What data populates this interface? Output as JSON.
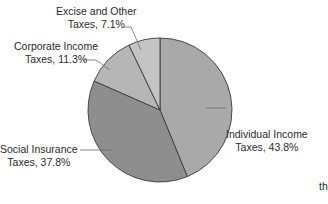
{
  "chart_data": {
    "type": "pie",
    "title": "",
    "categories": [
      "Individual Income Taxes",
      "Social Insurance Taxes",
      "Corporate Income Taxes",
      "Excise and Other Taxes"
    ],
    "values": [
      43.8,
      37.8,
      11.3,
      7.1
    ],
    "unit": "%",
    "start_angle_deg": 0,
    "direction": "clockwise",
    "slice_colors": [
      "#a9a9a9",
      "#8e8e8e",
      "#b6b6b6",
      "#c4c4c4"
    ],
    "edge_color": "#3a3a3a",
    "legend": "none (direct labels with leader lines)"
  },
  "labels": {
    "individual": {
      "line1": "Individual Income",
      "line2": "Taxes, 43.8%"
    },
    "social": {
      "line1": "Social Insurance",
      "line2": "Taxes, 37.8%"
    },
    "corporate": {
      "line1": "Corporate Income",
      "line2": "Taxes, 11.3%"
    },
    "excise": {
      "line1": "Excise and Other",
      "line2": "Taxes, 7.1%"
    }
  },
  "stray_text": "th"
}
